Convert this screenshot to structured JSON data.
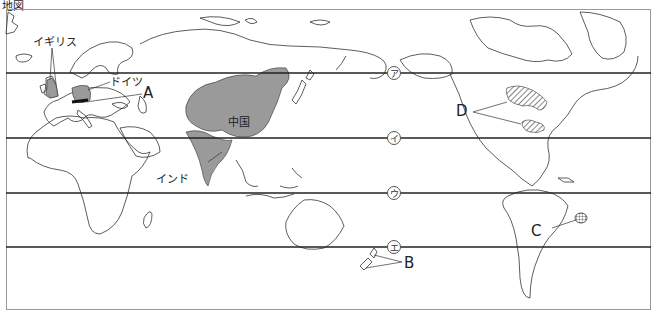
{
  "caption": "地図",
  "latitude_lines": [
    {
      "id": "a",
      "label": "ア",
      "y": 73
    },
    {
      "id": "i",
      "label": "イ",
      "y": 138
    },
    {
      "id": "u",
      "label": "ウ",
      "y": 193
    },
    {
      "id": "e",
      "label": "エ",
      "y": 247
    }
  ],
  "countries": {
    "uk": "イギリス",
    "germany": "ドイツ",
    "china": "中国",
    "india": "インド"
  },
  "markers": {
    "A": "A",
    "B": "B",
    "C": "C",
    "D": "D"
  },
  "colors": {
    "shaded": "#9a9a9a",
    "line": "#222222",
    "coast": "#333333"
  }
}
